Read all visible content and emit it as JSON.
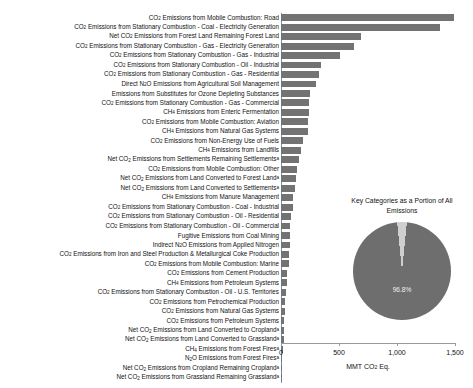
{
  "chart_data": {
    "type": "bar",
    "title": "",
    "orientation": "horizontal",
    "xlabel": "MMT CO2 Eq.",
    "ylabel": "",
    "xlim": [
      0,
      1500
    ],
    "xticks": [
      0,
      500,
      1000,
      1500
    ],
    "xtick_labels": [
      "0",
      "500",
      "1,000",
      "1,500"
    ],
    "grid": false,
    "legend": "none",
    "bar_color": "#737373",
    "categories": [
      "CO2 Emissions from Mobile Combustion: Road",
      "CO2 Emissions from Stationary Combustion - Coal - Electricity Generation",
      "Net CO2 Emissions from Forest Land Remaining Forest Land",
      "CO2 Emissions from Stationary Combustion - Gas - Electricity Generation",
      "CO2 Emissions from Stationary Combustion - Gas - Industrial",
      "CO2 Emissions from Stationary Combustion - Oil - Industrial",
      "CO2 Emissions from Stationary Combustion - Gas - Residential",
      "Direct N2O Emissions from Agricultural Soil Management",
      "Emissions from Substitutes for Ozone Depleting Substances",
      "CO2 Emissions from Stationary Combustion - Gas - Commercial",
      "CH4 Emissions from Enteric Fermentation",
      "CO2 Emissions from Mobile Combustion: Aviation",
      "CH4 Emissions from Natural Gas Systems",
      "CO2 Emissions from Non-Energy Use of Fuels",
      "CH4 Emissions from Landfills",
      "Net CO2 Emissions from Settlements Remaining Settlements a",
      "CO2 Emissions from Mobile Combustion: Other",
      "Net CO2 Emissions from Land Converted to Forest Land a",
      "Net CO2 Emissions from Land Converted to Settlements a",
      "CH4 Emissions from Manure Management",
      "CO2 Emissions from Stationary Combustion - Coal - Industrial",
      "CO2 Emissions from Stationary Combustion - Oil - Residential",
      "CO2 Emissions from Stationary Combustion - Oil - Commercial",
      "Fugitive Emissions from Coal Mining",
      "Indirect N2O Emissions from Applied Nitrogen",
      "CO2 Emissions from Iron and Steel Production & Metallurgical Coke Production",
      "CO2 Emissions from Mobile Combustion: Marine",
      "CO2 Emissions from Cement Production",
      "CH4 Emissions from Petroleum Systems",
      "CO2 Emissions from Stationary Combustion - Oil - U.S. Territories",
      "CO2 Emissions from Petrochemical Production",
      "CO2 Emissions from Natural Gas Systems",
      "CO2 Emissions from Petroleum Systems",
      "Net CO2 Emissions from Land Converted to Cropland a",
      "Net CO2 Emissions from Land Converted to Grassland a",
      "CH4 Emissions from Forest Fires a",
      "N2O Emissions from Forest Fires a",
      "Net CO2 Emissions from Cropland Remaining Cropland a",
      "Net CO2 Emissions from Grassland Remaining Grassland a"
    ],
    "values": [
      1495,
      1370,
      690,
      630,
      510,
      345,
      330,
      300,
      250,
      245,
      240,
      230,
      230,
      190,
      170,
      155,
      135,
      125,
      120,
      105,
      100,
      90,
      80,
      80,
      75,
      70,
      65,
      55,
      50,
      45,
      38,
      33,
      30,
      25,
      22,
      18,
      12,
      10,
      8
    ]
  },
  "bar_chart": {
    "labels_rich": [
      {
        "pre": "CO",
        "sub": "2",
        "post": " Emissions from Mobile Combustion: Road",
        "sup": ""
      },
      {
        "pre": "CO",
        "sub": "2",
        "post": " Emissions from Stationary Combustion - Coal - Electricity Generation",
        "sup": ""
      },
      {
        "pre": "Net CO",
        "sub": "2",
        "post": " Emissions from Forest Land Remaining Forest Land",
        "sup": ""
      },
      {
        "pre": "CO",
        "sub": "2",
        "post": " Emissions from Stationary Combustion - Gas - Electricity Generation",
        "sup": ""
      },
      {
        "pre": "CO",
        "sub": "2",
        "post": " Emissions from Stationary Combustion - Gas - Industrial",
        "sup": ""
      },
      {
        "pre": "CO",
        "sub": "2",
        "post": " Emissions from Stationary Combustion - Oil - Industrial",
        "sup": ""
      },
      {
        "pre": "CO",
        "sub": "2",
        "post": " Emissions from Stationary Combustion - Gas - Residential",
        "sup": ""
      },
      {
        "pre": "Direct N",
        "sub": "2",
        "post": "O Emissions from Agricultural Soil Management",
        "sup": ""
      },
      {
        "pre": "Emissions from Substitutes for Ozone Depleting Substances",
        "sub": "",
        "post": "",
        "sup": ""
      },
      {
        "pre": "CO",
        "sub": "2",
        "post": " Emissions from Stationary Combustion - Gas - Commercial",
        "sup": ""
      },
      {
        "pre": "CH",
        "sub": "4",
        "post": " Emissions from Enteric Fermentation",
        "sup": ""
      },
      {
        "pre": "CO",
        "sub": "2",
        "post": " Emissions from Mobile Combustion: Aviation",
        "sup": ""
      },
      {
        "pre": "CH",
        "sub": "4",
        "post": " Emissions from Natural Gas Systems",
        "sup": ""
      },
      {
        "pre": "CO",
        "sub": "2",
        "post": " Emissions from Non-Energy Use of Fuels",
        "sup": ""
      },
      {
        "pre": "CH",
        "sub": "4",
        "post": " Emissions from Landfills",
        "sup": ""
      },
      {
        "pre": "Net CO",
        "sub": "2",
        "post": " Emissions from Settlements Remaining Settlements",
        "sup": "a"
      },
      {
        "pre": "CO",
        "sub": "2",
        "post": " Emissions from Mobile Combustion: Other",
        "sup": ""
      },
      {
        "pre": "Net CO",
        "sub": "2",
        "post": " Emissions from Land Converted to Forest Land",
        "sup": "a"
      },
      {
        "pre": "Net CO",
        "sub": "2",
        "post": " Emissions from Land Converted to Settlements",
        "sup": "a"
      },
      {
        "pre": "CH",
        "sub": "4",
        "post": " Emissions from Manure Management",
        "sup": ""
      },
      {
        "pre": "CO",
        "sub": "2",
        "post": " Emissions from Stationary Combustion - Coal - Industrial",
        "sup": ""
      },
      {
        "pre": "CO",
        "sub": "2",
        "post": " Emissions from Stationary Combustion - Oil - Residential",
        "sup": ""
      },
      {
        "pre": "CO",
        "sub": "2",
        "post": " Emissions from Stationary Combustion - Oil - Commercial",
        "sup": ""
      },
      {
        "pre": "Fugitive Emissions from Coal Mining",
        "sub": "",
        "post": "",
        "sup": ""
      },
      {
        "pre": "Indirect N",
        "sub": "2",
        "post": "O Emissions from Applied Nitrogen",
        "sup": ""
      },
      {
        "pre": "CO",
        "sub": "2",
        "post": " Emissions from Iron and Steel Production & Metallurgical Coke Production",
        "sup": ""
      },
      {
        "pre": "CO",
        "sub": "2",
        "post": " Emissions from Mobile Combustion: Marine",
        "sup": ""
      },
      {
        "pre": "CO",
        "sub": "2",
        "post": " Emissions from Cement Production",
        "sup": ""
      },
      {
        "pre": "CH",
        "sub": "4",
        "post": " Emissions from Petroleum Systems",
        "sup": ""
      },
      {
        "pre": "CO",
        "sub": "2",
        "post": " Emissions from Stationary Combustion - Oil - U.S. Territories",
        "sup": ""
      },
      {
        "pre": "CO",
        "sub": "2",
        "post": " Emissions from Petrochemical Production",
        "sup": ""
      },
      {
        "pre": "CO",
        "sub": "2",
        "post": " Emissions from Natural Gas Systems",
        "sup": ""
      },
      {
        "pre": "CO",
        "sub": "2",
        "post": " Emissions from Petroleum Systems",
        "sup": ""
      },
      {
        "pre": "Net CO",
        "sub": "2",
        "post": " Emissions from Land Converted to Cropland",
        "sup": "a"
      },
      {
        "pre": "Net CO",
        "sub": "2",
        "post": " Emissions from Land Converted to Grassland",
        "sup": "a"
      },
      {
        "pre": "CH",
        "sub": "4",
        "post": " Emissions from Forest Fires",
        "sup": "a"
      },
      {
        "pre": "N",
        "sub": "2",
        "post": "O Emissions from Forest Fires",
        "sup": "a"
      },
      {
        "pre": "Net CO",
        "sub": "2",
        "post": " Emissions from Cropland Remaining Cropland",
        "sup": "a"
      },
      {
        "pre": "Net CO",
        "sub": "2",
        "post": " Emissions from Grassland Remaining Grassland",
        "sup": "a"
      }
    ],
    "axis_title": {
      "pre": "MMT CO",
      "sub": "2",
      "post": " Eq."
    }
  },
  "pie_chart": {
    "type": "pie",
    "title": "Key Categories as a Portion of All Emissions",
    "slices": [
      {
        "label": "Key Categories",
        "value": 96.8,
        "color": "#6e6e6e",
        "display": "96.8%"
      },
      {
        "label": "Other",
        "value": 3.2,
        "color": "#cfcfcf",
        "display": ""
      }
    ],
    "value_label": "96.8%"
  }
}
